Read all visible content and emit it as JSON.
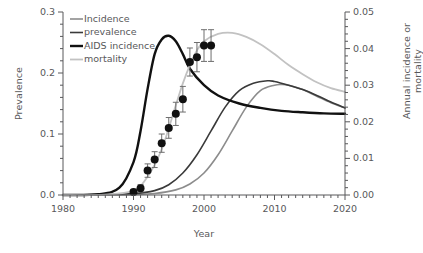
{
  "chart_data": {
    "type": "line",
    "title": "",
    "xlabel": "Year",
    "ylabel": "Prevalence",
    "y2label": "Annual incidence or mortality",
    "xlim": [
      1980,
      2020
    ],
    "ylim": [
      0.0,
      0.3
    ],
    "y2lim": [
      0.0,
      0.05
    ],
    "xticks": [
      1980,
      1990,
      2000,
      2010,
      2020
    ],
    "xticklabels": [
      "1980",
      "1990",
      "2000",
      "2010",
      "2020"
    ],
    "yticks": [
      0.0,
      0.1,
      0.2,
      0.3
    ],
    "yticklabels": [
      "0.0",
      "0.1",
      "0.2",
      "0.3"
    ],
    "y2ticks": [
      0.0,
      0.01,
      0.02,
      0.03,
      0.04,
      0.05
    ],
    "y2ticklabels": [
      "0.00",
      "0.01",
      "0.02",
      "0.03",
      "0.04",
      "0.05"
    ],
    "grid": false,
    "legend_position": "top-left",
    "minor_ticks": "annual",
    "legend": [
      {
        "label": "Incidence",
        "color": "#8c8c8c",
        "width": 1.6,
        "axis": "right"
      },
      {
        "label": "prevalence",
        "color": "#3a3a3a",
        "width": 1.6,
        "axis": "right"
      },
      {
        "label": "AIDS incidence",
        "color": "#111111",
        "width": 2.4,
        "axis": "right"
      },
      {
        "label": "mortality",
        "color": "#c2c2c2",
        "width": 1.8,
        "axis": "right"
      }
    ],
    "series": [
      {
        "name": "Incidence",
        "axis": "right",
        "color": "#8c8c8c",
        "x": [
          1980,
          1985,
          1990,
          1993,
          1996,
          1998,
          2000,
          2002,
          2004,
          2006,
          2008,
          2010,
          2011,
          2012,
          2014,
          2016,
          2018,
          2020
        ],
        "values": [
          0.0,
          0.0,
          0.0001,
          0.0004,
          0.0014,
          0.003,
          0.006,
          0.011,
          0.0175,
          0.024,
          0.0285,
          0.03,
          0.0302,
          0.03,
          0.0288,
          0.027,
          0.0252,
          0.0238
        ]
      },
      {
        "name": "prevalence",
        "axis": "right",
        "color": "#3a3a3a",
        "x": [
          1980,
          1985,
          1990,
          1993,
          1995,
          1997,
          1999,
          2001,
          2003,
          2005,
          2007,
          2009,
          2010,
          2012,
          2014,
          2016,
          2018,
          2020
        ],
        "values": [
          0.0,
          0.0001,
          0.0004,
          0.0012,
          0.0028,
          0.006,
          0.011,
          0.0175,
          0.024,
          0.0285,
          0.0305,
          0.0312,
          0.031,
          0.03,
          0.0288,
          0.0272,
          0.0254,
          0.0238
        ]
      },
      {
        "name": "AIDS incidence",
        "axis": "right",
        "color": "#111111",
        "x": [
          1980,
          1985,
          1988,
          1990,
          1991,
          1992,
          1993,
          1994,
          1995,
          1996,
          1997,
          1998,
          2000,
          2002,
          2005,
          2008,
          2011,
          2014,
          2017,
          2020
        ],
        "values": [
          0.0,
          0.0002,
          0.002,
          0.009,
          0.0175,
          0.029,
          0.0385,
          0.0425,
          0.0435,
          0.042,
          0.0385,
          0.0345,
          0.03,
          0.0272,
          0.025,
          0.0238,
          0.023,
          0.0226,
          0.0223,
          0.0222
        ]
      },
      {
        "name": "mortality",
        "axis": "right",
        "color": "#c2c2c2",
        "x": [
          1980,
          1986,
          1990,
          1992,
          1994,
          1996,
          1997,
          1998,
          1999,
          2000,
          2002,
          2004,
          2006,
          2008,
          2010,
          2012,
          2014,
          2016,
          2018,
          2020
        ],
        "values": [
          0.0,
          0.0001,
          0.0012,
          0.005,
          0.0125,
          0.0245,
          0.0305,
          0.0355,
          0.0395,
          0.042,
          0.044,
          0.0443,
          0.0432,
          0.0412,
          0.0385,
          0.0355,
          0.033,
          0.0308,
          0.0292,
          0.0282
        ]
      }
    ],
    "observed_prevalence": {
      "name": "observed prevalence",
      "axis": "left",
      "marker": "filled-circle",
      "color": "#111111",
      "errorbar_color": "#6e6e6e",
      "points": [
        {
          "x": 1990,
          "y": 0.005,
          "err": 0.004
        },
        {
          "x": 1991,
          "y": 0.011,
          "err": 0.006
        },
        {
          "x": 1992,
          "y": 0.04,
          "err": 0.011
        },
        {
          "x": 1993,
          "y": 0.058,
          "err": 0.013
        },
        {
          "x": 1994,
          "y": 0.085,
          "err": 0.015
        },
        {
          "x": 1995,
          "y": 0.11,
          "err": 0.017
        },
        {
          "x": 1996,
          "y": 0.133,
          "err": 0.019
        },
        {
          "x": 1997,
          "y": 0.157,
          "err": 0.021
        },
        {
          "x": 1998,
          "y": 0.218,
          "err": 0.023
        },
        {
          "x": 1999,
          "y": 0.226,
          "err": 0.024
        },
        {
          "x": 2000,
          "y": 0.245,
          "err": 0.026
        },
        {
          "x": 2001,
          "y": 0.245,
          "err": 0.026
        }
      ]
    }
  },
  "axes": {
    "x_title": "Year",
    "y_title": "Prevalence",
    "y2_title": "Annual incidence or mortality"
  }
}
